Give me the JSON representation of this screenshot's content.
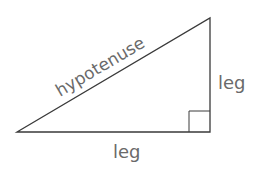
{
  "diagram": {
    "labels": {
      "hypotenuse": "hypotenuse",
      "vertical_leg": "leg",
      "horizontal_leg": "leg"
    },
    "vertices": {
      "left": [
        17,
        132
      ],
      "top": [
        210,
        18
      ],
      "right_angle": [
        210,
        132
      ]
    },
    "right_angle_marker_size": 21,
    "colors": {
      "stroke": "#3a3a3a",
      "text": "#6a6a6a",
      "background": "#ffffff"
    }
  }
}
